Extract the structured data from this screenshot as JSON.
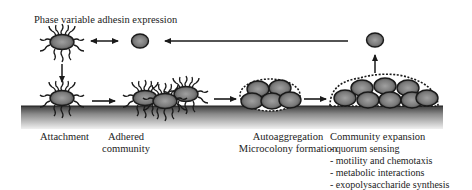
{
  "figure": {
    "title": "Phase variable adhesin expression",
    "stages": [
      {
        "id": "attachment",
        "lines": [
          "Attachment"
        ]
      },
      {
        "id": "adhered-community",
        "lines": [
          "Adhered",
          "community"
        ]
      },
      {
        "id": "autoaggregation",
        "lines": [
          "Autoaggregation",
          "Microcolony formation"
        ]
      },
      {
        "id": "community-expansion",
        "lines": [
          "Community expansion"
        ],
        "bullets": [
          "- quorum sensing",
          "- motility and chemotaxis",
          "- metabolic interactions",
          "- exopolysaccharide synthesis"
        ]
      }
    ],
    "colors": {
      "surface_top": "#4a4a4a",
      "surface_bottom": "#e6e6e6",
      "cell_fill": "#7a7a7a",
      "cell_core": "#a8a8a8",
      "outline": "#1a1a1a"
    }
  }
}
